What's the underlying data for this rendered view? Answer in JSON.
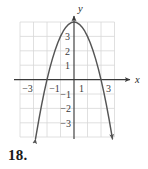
{
  "exercise": {
    "number": "18."
  },
  "chart_data": {
    "type": "line",
    "title": "",
    "subtitle": "",
    "xlabel": "x",
    "ylabel": "y",
    "xlim": [
      -4,
      4
    ],
    "ylim": [
      -4,
      4
    ],
    "grid": true,
    "grid_step": 1,
    "legend": "none",
    "curve_description": "downward-opening parabola with vertex at (0, 4), arrowheads on both ends",
    "function": "y = -x^2 + 4",
    "vertex": [
      0,
      4
    ],
    "x_intercepts": [
      -2,
      2
    ],
    "y_intercept": 4,
    "x_tick_labels": [
      "−3",
      "−1",
      "1",
      "3"
    ],
    "x_tick_values": [
      -3,
      -1,
      1,
      3
    ],
    "y_tick_labels": [
      "3",
      "2",
      "1",
      "−1",
      "−2",
      "−3"
    ],
    "y_tick_values": [
      3,
      2,
      1,
      -1,
      -2,
      -3
    ],
    "x": [
      -2.85,
      -2.6,
      -2.4,
      -2.2,
      -2,
      -1.8,
      -1.6,
      -1.4,
      -1.2,
      -1,
      -0.8,
      -0.6,
      -0.4,
      -0.2,
      0,
      0.2,
      0.4,
      0.6,
      0.8,
      1,
      1.2,
      1.4,
      1.6,
      1.8,
      2,
      2.2,
      2.4,
      2.6,
      2.85
    ],
    "y": [
      -4.12,
      -2.76,
      -1.76,
      -0.84,
      0,
      0.76,
      1.44,
      2.04,
      2.56,
      3,
      3.36,
      3.64,
      3.84,
      3.96,
      4,
      3.96,
      3.84,
      3.64,
      3.36,
      3,
      2.56,
      2.04,
      1.44,
      0.76,
      0,
      -0.84,
      -1.76,
      -2.76,
      -4.12
    ],
    "colors": {
      "curve": "#555555",
      "axis": "#3a3a3a",
      "grid": "#d8d8d8",
      "background": "#ffffff",
      "label": "#3a3a3a"
    }
  }
}
